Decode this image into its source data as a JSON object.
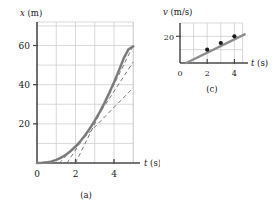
{
  "figure": {
    "panels": [
      {
        "id": "a",
        "caption": "(a)",
        "chart_data": {
          "type": "line",
          "title": "",
          "xlabel": "t (s)",
          "ylabel": "x (m)",
          "xlim": [
            0,
            5.35
          ],
          "ylim": [
            0,
            72
          ],
          "grid": true,
          "xticks": [
            0,
            2,
            4
          ],
          "xticklabels": [
            "0",
            "2",
            "4"
          ],
          "yticks": [
            20,
            40,
            60
          ],
          "yticklabels": [
            "20",
            "40",
            "60"
          ],
          "gridlines_x": [
            1,
            2,
            3,
            4,
            5
          ],
          "gridlines_y": [
            10,
            20,
            30,
            40,
            50,
            60,
            70
          ],
          "series": [
            {
              "name": "position curve",
              "style": "solid-thick",
              "color": "#8c8c8c",
              "x": [
                0,
                0.25,
                0.5,
                0.75,
                1.0,
                1.25,
                1.5,
                1.75,
                2.0,
                2.25,
                2.5,
                2.75,
                3.0,
                3.25,
                3.5,
                3.75,
                4.0,
                4.25,
                4.5,
                4.75,
                5.0
              ],
              "values": [
                0,
                0.1,
                0.3,
                0.8,
                1.6,
                2.7,
                4.2,
                6.1,
                8.4,
                11.1,
                14.2,
                17.7,
                21.6,
                25.9,
                30.6,
                35.7,
                41.2,
                47.1,
                53.4,
                58.0,
                59.5
              ]
            },
            {
              "name": "tangent at t=2",
              "style": "dashed",
              "color": "#6b6b6b",
              "tangent_at": 2,
              "slope": 10,
              "x": [
                1.16,
                5.0
              ],
              "values": [
                0,
                38.4
              ]
            },
            {
              "name": "tangent at t=3",
              "style": "dashed",
              "color": "#6b6b6b",
              "tangent_at": 3,
              "slope": 15,
              "x": [
                1.56,
                5.0
              ],
              "values": [
                0,
                51.6
              ]
            },
            {
              "name": "tangent at t=4",
              "style": "dashed",
              "color": "#6b6b6b",
              "tangent_at": 4,
              "slope": 20,
              "x": [
                2.0,
                5.0
              ],
              "values": [
                0,
                60.0
              ]
            }
          ]
        }
      },
      {
        "id": "c",
        "caption": "(c)",
        "chart_data": {
          "type": "scatter",
          "title": "",
          "xlabel": "t (s)",
          "ylabel": "v (m/s)",
          "xlim": [
            0,
            5.0
          ],
          "ylim": [
            0,
            30
          ],
          "grid": true,
          "xticks": [
            0,
            2,
            4
          ],
          "xticklabels": [
            "0",
            "2",
            "4"
          ],
          "yticks": [
            20
          ],
          "yticklabels": [
            "20"
          ],
          "gridlines_x": [
            1,
            2,
            3,
            4
          ],
          "gridlines_y": [
            10,
            20,
            30
          ],
          "series": [
            {
              "name": "velocity fit line",
              "style": "solid-thick",
              "color": "#8c8c8c",
              "x": [
                0.45,
                4.75
              ],
              "values": [
                0,
                21.5
              ]
            },
            {
              "name": "velocity data points",
              "style": "markers",
              "color": "#1a1a1a",
              "x": [
                2,
                3,
                4
              ],
              "values": [
                10,
                15,
                20
              ]
            }
          ]
        }
      }
    ]
  }
}
